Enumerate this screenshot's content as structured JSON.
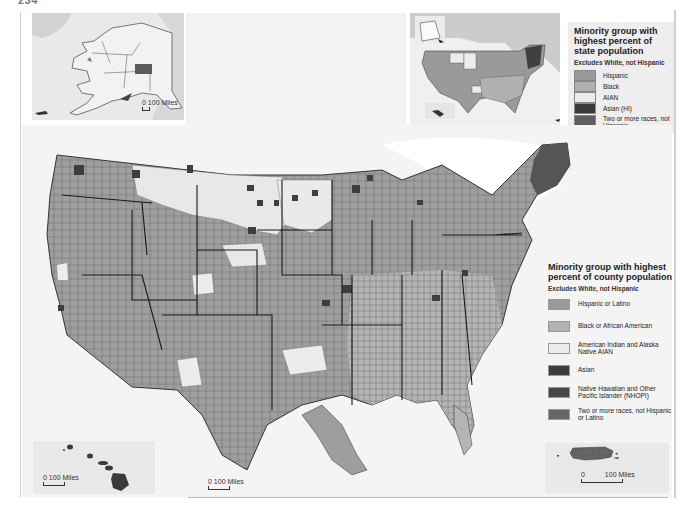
{
  "page": {
    "page_number": "234",
    "running_title": "CHAPTER 10  •  ..."
  },
  "colors": {
    "hispanic": "#9a9a9a",
    "black": "#b2b2b2",
    "aian": "#ececec",
    "asian": "#3c3c3c",
    "nhopi": "#4a4a4a",
    "two_or_more": "#6a6a6a",
    "water": "#ffffff",
    "land_other": "#d8d8d8",
    "border": "#333333"
  },
  "state_legend": {
    "title": "Minority group with highest percent of state population",
    "subtitle": "Excludes White, not Hispanic",
    "items": [
      {
        "label": "Hispanic",
        "color": "#9a9a9a"
      },
      {
        "label": "Black",
        "color": "#b0b0b0"
      },
      {
        "label": "AIAN",
        "color": "#ececec"
      },
      {
        "label": "Asian (HI)",
        "color": "#3a3a3a"
      },
      {
        "label": "Two or more races, not Hispanic",
        "color": "#5e5e5e"
      }
    ]
  },
  "county_legend": {
    "title": "Minority group with highest percent of county population",
    "subtitle": "Excludes White, not Hispanic",
    "items": [
      {
        "label": "Hispanic or Latino",
        "color": "#9a9a9a"
      },
      {
        "label": "Black or African American",
        "color": "#b2b2b2"
      },
      {
        "label": "American Indian and Alaska Native AIAN",
        "color": "#ececec"
      },
      {
        "label": "Asian",
        "color": "#3c3c3c"
      },
      {
        "label": "Native Hawaiian and Other Pacific Islander (NHOPI)",
        "color": "#474747"
      },
      {
        "label": "Two or more races, not Hispanic or Latino",
        "color": "#666666"
      }
    ]
  },
  "scales": {
    "alaska": {
      "zero": "0",
      "label": "100 Miles"
    },
    "hawaii": {
      "zero": "0",
      "label": "100 Miles"
    },
    "conus": {
      "zero": "0",
      "label": "100 Miles"
    },
    "puerto_rico": {
      "zero": "0",
      "label": "100 Miles"
    }
  },
  "insets": {
    "alaska": "Alaska",
    "hawaii": "Hawaii",
    "puerto_rico": "Puerto Rico",
    "state_overview": "United States by state"
  }
}
